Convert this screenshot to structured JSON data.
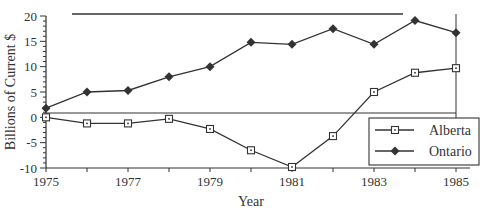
{
  "chart_data": {
    "type": "line",
    "title": "",
    "xlabel": "Year",
    "ylabel": "Billions of Current $",
    "xlim": [
      1975,
      1985
    ],
    "ylim": [
      -10,
      20
    ],
    "x_ticks": [
      1975,
      1977,
      1979,
      1981,
      1983,
      1985
    ],
    "y_ticks": [
      20,
      15,
      10,
      5,
      0,
      -5,
      -10
    ],
    "grid": false,
    "legend_position": "lower right",
    "x": [
      1975,
      1976,
      1977,
      1978,
      1979,
      1980,
      1981,
      1982,
      1983,
      1984,
      1985
    ],
    "series": [
      {
        "name": "Alberta",
        "marker": "open-square",
        "values": [
          0,
          -1.2,
          -1.2,
          -0.3,
          -2.3,
          -6.5,
          -9.8,
          -3.7,
          5.0,
          8.8,
          9.7
        ]
      },
      {
        "name": "Ontario",
        "marker": "filled-diamond",
        "values": [
          1.8,
          5.0,
          5.3,
          8.0,
          10.0,
          14.8,
          14.4,
          17.5,
          14.4,
          19.1,
          16.7
        ]
      }
    ]
  },
  "colors": {
    "line": "#333333",
    "background": "#ffffff"
  }
}
